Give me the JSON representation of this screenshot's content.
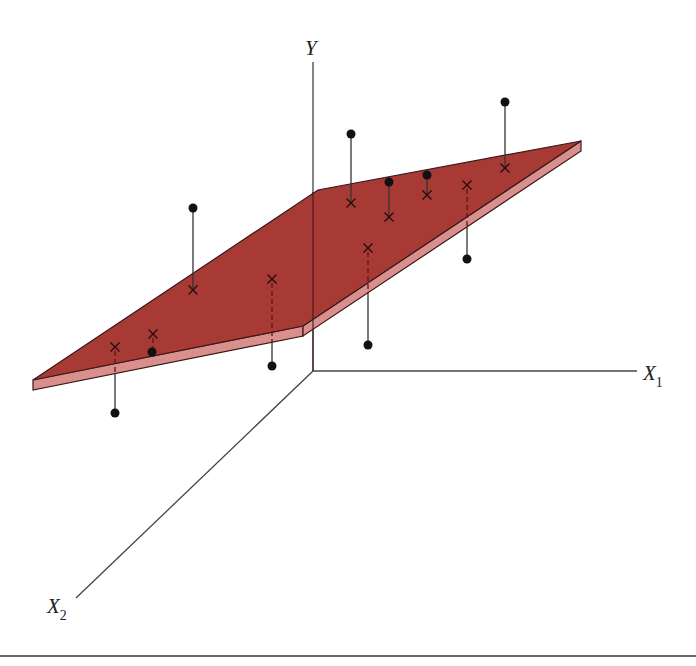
{
  "figure": {
    "colors": {
      "plane_top": "#a83a36",
      "plane_edge": "#d9908c",
      "outline": "#3a1a18",
      "axis": "#444444",
      "point": "#111111"
    },
    "axes": {
      "y_label": "Y",
      "x1_label": "X",
      "x1_sub": "1",
      "x2_label": "X",
      "x2_sub": "2"
    },
    "legend_notes": {
      "observed": "● observed value",
      "fitted": "× fitted value on plane",
      "solid_residual": "solid line: point above plane",
      "dashed_residual": "dashed line: segment hidden below plane"
    },
    "points": [
      {
        "fit": [
          115,
          347
        ],
        "obs": [
          115,
          413
        ],
        "side": "below"
      },
      {
        "fit": [
          153,
          334
        ],
        "obs": [
          152,
          352
        ],
        "side": "below"
      },
      {
        "fit": [
          193,
          290
        ],
        "obs": [
          193,
          208
        ],
        "side": "above"
      },
      {
        "fit": [
          272,
          279
        ],
        "obs": [
          272,
          366
        ],
        "side": "below"
      },
      {
        "fit": [
          351,
          203
        ],
        "obs": [
          351,
          134
        ],
        "side": "above"
      },
      {
        "fit": [
          368,
          248
        ],
        "obs": [
          368,
          345
        ],
        "side": "below"
      },
      {
        "fit": [
          389,
          217
        ],
        "obs": [
          389,
          182
        ],
        "side": "above"
      },
      {
        "fit": [
          427,
          195
        ],
        "obs": [
          427,
          175
        ],
        "side": "above"
      },
      {
        "fit": [
          467,
          185
        ],
        "obs": [
          467,
          259
        ],
        "side": "below"
      },
      {
        "fit": [
          505,
          168
        ],
        "obs": [
          505,
          102
        ],
        "side": "above"
      }
    ]
  }
}
